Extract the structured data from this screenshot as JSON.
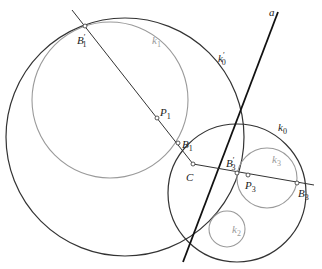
{
  "figure": {
    "width": 322,
    "height": 269,
    "colors": {
      "dark_stroke": "#333333",
      "gray_stroke": "#9a9a9a",
      "line_a": "#111111",
      "background": "#ffffff"
    }
  },
  "circles": [
    {
      "id": "k0p",
      "label_base": "k",
      "label_sub": "0",
      "label_prime": "′",
      "cx": 125,
      "cy": 137,
      "r": 119,
      "style": "dark",
      "label_x": 218,
      "label_y": 62
    },
    {
      "id": "k1",
      "label_base": "k",
      "label_sub": "1",
      "label_prime": "",
      "cx": 110,
      "cy": 100,
      "r": 78,
      "style": "gray",
      "label_x": 152,
      "label_y": 44
    },
    {
      "id": "k0",
      "label_base": "k",
      "label_sub": "0",
      "label_prime": "",
      "cx": 237,
      "cy": 193,
      "r": 69,
      "style": "dark",
      "label_x": 278,
      "label_y": 131
    },
    {
      "id": "k3",
      "label_base": "k",
      "label_sub": "3",
      "label_prime": "",
      "cx": 267,
      "cy": 178,
      "r": 30,
      "style": "gray",
      "label_x": 272,
      "label_y": 163
    },
    {
      "id": "k2",
      "label_base": "k",
      "label_sub": "2",
      "label_prime": "",
      "cx": 227,
      "cy": 229,
      "r": 18,
      "style": "gray",
      "label_x": 232,
      "label_y": 233
    }
  ],
  "lines": [
    {
      "id": "line-a",
      "label": "a",
      "x1": 278,
      "y1": 12,
      "x2": 183,
      "y2": 262,
      "style": "bold",
      "label_x": 269,
      "label_y": 16
    },
    {
      "id": "line-b1p-c",
      "x1": 72,
      "y1": 10,
      "x2": 193,
      "y2": 164,
      "style": "thin"
    },
    {
      "id": "line-c-b3",
      "x1": 193,
      "y1": 164,
      "x2": 314,
      "y2": 185,
      "style": "thin"
    }
  ],
  "points": [
    {
      "id": "B1p",
      "label_base": "B",
      "label_sub": "1",
      "label_prime": "′",
      "x": 85,
      "y": 26,
      "label_x": 77,
      "label_y": 44
    },
    {
      "id": "P1",
      "label_base": "P",
      "label_sub": "1",
      "label_prime": "",
      "x": 157,
      "y": 118,
      "label_x": 160,
      "label_y": 116
    },
    {
      "id": "B1",
      "label_base": "B",
      "label_sub": "1",
      "label_prime": "",
      "x": 178,
      "y": 143,
      "label_x": 182,
      "label_y": 148
    },
    {
      "id": "C",
      "label_base": "C",
      "label_sub": "",
      "label_prime": "",
      "x": 193,
      "y": 164,
      "label_x": 186,
      "label_y": 181
    },
    {
      "id": "B3p",
      "label_base": "B",
      "label_sub": "3",
      "label_prime": "′",
      "x": 237,
      "y": 173,
      "label_x": 226,
      "label_y": 167
    },
    {
      "id": "P3",
      "label_base": "P",
      "label_sub": "3",
      "label_prime": "",
      "x": 248,
      "y": 175,
      "label_x": 245,
      "label_y": 189
    },
    {
      "id": "B3",
      "label_base": "B",
      "label_sub": "3",
      "label_prime": "",
      "x": 297,
      "y": 183,
      "label_x": 298,
      "label_y": 197
    }
  ]
}
